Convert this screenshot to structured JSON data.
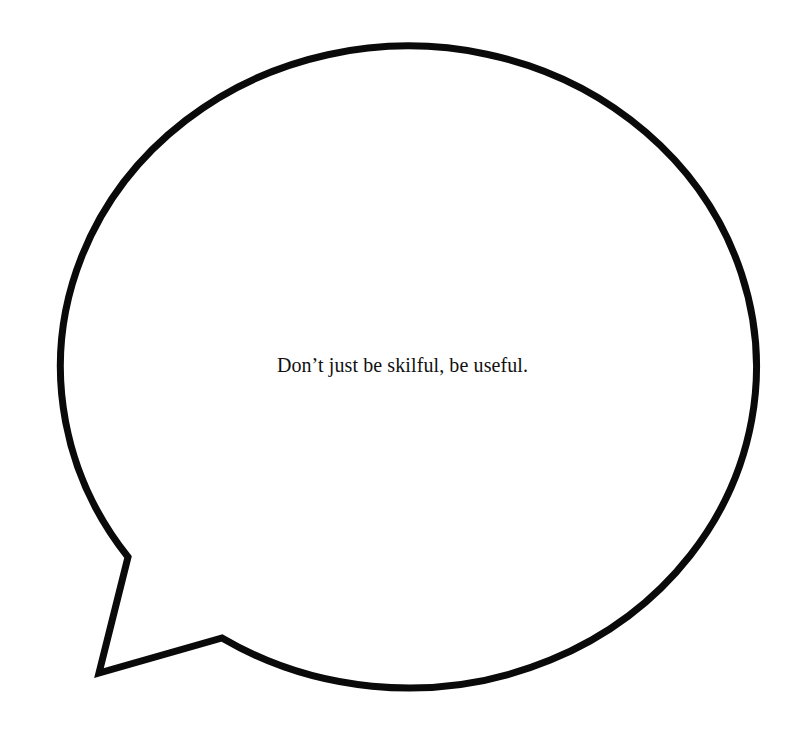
{
  "bubble": {
    "text": "Don’t just be skilful, be useful.",
    "stroke_color": "#0a0a0a",
    "fill_color": "#ffffff",
    "tail_position": "bottom-left"
  }
}
